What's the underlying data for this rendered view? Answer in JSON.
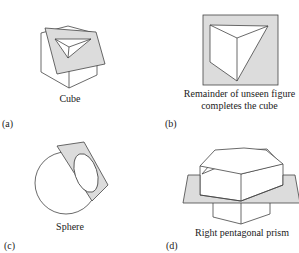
{
  "panels": [
    {
      "id": "a",
      "label": "(a)",
      "caption": "Cube"
    },
    {
      "id": "b",
      "label": "(b)",
      "caption_line1": "Remainder of unseen figure",
      "caption_line2": "completes the cube"
    },
    {
      "id": "c",
      "label": "(c)",
      "caption": "Sphere"
    },
    {
      "id": "d",
      "label": "(d)",
      "caption": "Right pentagonal prism"
    }
  ],
  "colors": {
    "plane_fill": "#dcdcdc",
    "stroke": "#444444"
  }
}
